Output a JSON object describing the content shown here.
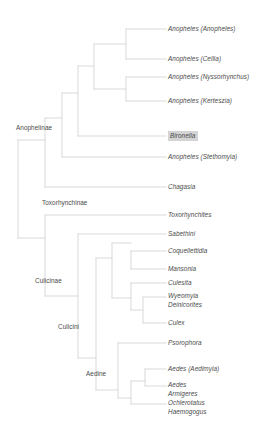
{
  "figure": {
    "type": "phylogenetic-cladogram",
    "title": "",
    "line_color": "#d9d9d9",
    "text_color": "#4a4a4a",
    "highlight_color": "#d4d4d4",
    "background": "#ffffff"
  },
  "tips": [
    {
      "id": "anopheles-anopheles",
      "label": "Anopheles (Anopheles)",
      "x": 168,
      "y": 29,
      "highlight": false
    },
    {
      "id": "anopheles-cellia",
      "label": "Anopheles (Cellia)",
      "x": 168,
      "y": 59,
      "highlight": false
    },
    {
      "id": "anopheles-nyssorhynchus",
      "label": "Anopheles (Nyssorhynchus)",
      "x": 168,
      "y": 77,
      "highlight": false
    },
    {
      "id": "anopheles-kerteszia",
      "label": "Anopheles (Kerteszia)",
      "x": 168,
      "y": 101,
      "highlight": false
    },
    {
      "id": "bironella",
      "label": "Bironella",
      "x": 168,
      "y": 136,
      "highlight": true
    },
    {
      "id": "anopheles-stethomyia",
      "label": "Anopheles (Stethomyia)",
      "x": 168,
      "y": 157,
      "highlight": false
    },
    {
      "id": "chagasia",
      "label": "Chagasia",
      "x": 168,
      "y": 187,
      "highlight": false
    },
    {
      "id": "toxorhynchites",
      "label": "Toxorhynchites",
      "x": 168,
      "y": 215,
      "highlight": false
    },
    {
      "id": "sabethini",
      "label": "Sabethini",
      "x": 168,
      "y": 234,
      "highlight": false
    },
    {
      "id": "coquellettidia",
      "label": "Coquellettidia",
      "x": 168,
      "y": 251,
      "highlight": false
    },
    {
      "id": "mansonia",
      "label": "Mansonia",
      "x": 168,
      "y": 269,
      "highlight": false
    },
    {
      "id": "culiseta",
      "label": "Culesita",
      "x": 168,
      "y": 283,
      "highlight": false
    },
    {
      "id": "culex",
      "label": "Culex",
      "x": 168,
      "y": 323,
      "highlight": false
    },
    {
      "id": "psorophora",
      "label": "Psorophora",
      "x": 168,
      "y": 343,
      "highlight": false
    },
    {
      "id": "aedes-aedimyia",
      "label": "Aedes (Aedimyia)",
      "x": 168,
      "y": 369,
      "highlight": false
    }
  ],
  "tip_stacks": [
    {
      "id": "wyeomyia-deinocerites",
      "x": 168,
      "y": 297,
      "lines": [
        "Wyeomyia",
        "Deinicorites"
      ]
    },
    {
      "id": "aedes-armigeres",
      "x": 168,
      "y": 386,
      "lines": [
        "Aedes",
        "Armigeres"
      ]
    },
    {
      "id": "ochlerotatus-haemogogus",
      "x": 168,
      "y": 404,
      "lines": [
        "Ochlerotatus",
        "Haemogogus"
      ]
    }
  ],
  "clades": [
    {
      "id": "anophelinae",
      "label": "Anophelinae",
      "x": 16,
      "y": 128
    },
    {
      "id": "toxorhynchinae",
      "label": "Toxorhynchinae",
      "x": 42,
      "y": 203
    },
    {
      "id": "culicinae",
      "label": "Culicinae",
      "x": 35,
      "y": 281
    },
    {
      "id": "culicini",
      "label": "Culicini",
      "x": 58,
      "y": 327
    },
    {
      "id": "aedine",
      "label": "Aedine",
      "x": 86,
      "y": 374
    }
  ],
  "branches": [
    {
      "id": "root-vertical",
      "x1": 18,
      "y1": 140,
      "x2": 18,
      "y2": 238
    },
    {
      "id": "root-to-anophelinae",
      "x1": 18,
      "y1": 140,
      "x2": 45,
      "y2": 140
    },
    {
      "id": "root-to-culicinae",
      "x1": 18,
      "y1": 238,
      "x2": 45,
      "y2": 238
    },
    {
      "id": "anophelinae-vertical",
      "x1": 45,
      "y1": 118,
      "x2": 45,
      "y2": 187
    },
    {
      "id": "anophelinae-to-chagasia",
      "x1": 45,
      "y1": 187,
      "x2": 166,
      "y2": 187
    },
    {
      "id": "anophelinae-to-node2",
      "x1": 45,
      "y1": 118,
      "x2": 62,
      "y2": 118
    },
    {
      "id": "node2-vertical",
      "x1": 62,
      "y1": 93,
      "x2": 62,
      "y2": 157
    },
    {
      "id": "node2-to-stethomyia",
      "x1": 62,
      "y1": 157,
      "x2": 166,
      "y2": 157
    },
    {
      "id": "node2-to-node3",
      "x1": 62,
      "y1": 93,
      "x2": 78,
      "y2": 93
    },
    {
      "id": "node3-vertical",
      "x1": 78,
      "y1": 66,
      "x2": 78,
      "y2": 136
    },
    {
      "id": "node3-to-bironella",
      "x1": 78,
      "y1": 136,
      "x2": 166,
      "y2": 136
    },
    {
      "id": "node3-to-node4",
      "x1": 78,
      "y1": 66,
      "x2": 94,
      "y2": 66
    },
    {
      "id": "node4-vertical",
      "x1": 94,
      "y1": 44,
      "x2": 94,
      "y2": 89
    },
    {
      "id": "node4-to-upper-pair",
      "x1": 94,
      "y1": 44,
      "x2": 126,
      "y2": 44
    },
    {
      "id": "node4-to-lower-pair",
      "x1": 94,
      "y1": 89,
      "x2": 126,
      "y2": 89
    },
    {
      "id": "upper-pair-vertical",
      "x1": 126,
      "y1": 29,
      "x2": 126,
      "y2": 59
    },
    {
      "id": "tip-anopheles-anopheles",
      "x1": 126,
      "y1": 29,
      "x2": 166,
      "y2": 29
    },
    {
      "id": "tip-anopheles-cellia",
      "x1": 126,
      "y1": 59,
      "x2": 166,
      "y2": 59
    },
    {
      "id": "lower-pair-vertical",
      "x1": 126,
      "y1": 77,
      "x2": 126,
      "y2": 101
    },
    {
      "id": "tip-anopheles-nyssorhynchus",
      "x1": 126,
      "y1": 77,
      "x2": 166,
      "y2": 77
    },
    {
      "id": "tip-anopheles-kerteszia",
      "x1": 126,
      "y1": 101,
      "x2": 166,
      "y2": 101
    },
    {
      "id": "culicinae-vertical",
      "x1": 45,
      "y1": 215,
      "x2": 45,
      "y2": 296
    },
    {
      "id": "culicinae-to-toxorhynchites",
      "x1": 45,
      "y1": 215,
      "x2": 166,
      "y2": 215
    },
    {
      "id": "culicinae-to-node6",
      "x1": 45,
      "y1": 296,
      "x2": 78,
      "y2": 296
    },
    {
      "id": "node6-vertical",
      "x1": 78,
      "y1": 234,
      "x2": 78,
      "y2": 358
    },
    {
      "id": "node6-to-sabethini",
      "x1": 78,
      "y1": 234,
      "x2": 166,
      "y2": 234
    },
    {
      "id": "node6-to-aedine",
      "x1": 78,
      "y1": 358,
      "x2": 96,
      "y2": 358
    },
    {
      "id": "culicini-vertical",
      "x1": 96,
      "y1": 258,
      "x2": 96,
      "y2": 390
    },
    {
      "id": "culicini-upper",
      "x1": 96,
      "y1": 258,
      "x2": 112,
      "y2": 258
    },
    {
      "id": "node7-vertical",
      "x1": 112,
      "y1": 243,
      "x2": 112,
      "y2": 298
    },
    {
      "id": "node7-to-coq-man",
      "x1": 112,
      "y1": 243,
      "x2": 131,
      "y2": 243
    },
    {
      "id": "node7-to-node9",
      "x1": 112,
      "y1": 298,
      "x2": 131,
      "y2": 298
    },
    {
      "id": "coq-man-vertical",
      "x1": 131,
      "y1": 251,
      "x2": 131,
      "y2": 269
    },
    {
      "id": "tip-coquellettidia",
      "x1": 131,
      "y1": 251,
      "x2": 166,
      "y2": 251
    },
    {
      "id": "tip-mansonia",
      "x1": 131,
      "y1": 269,
      "x2": 166,
      "y2": 269
    },
    {
      "id": "node9-vertical",
      "x1": 131,
      "y1": 283,
      "x2": 131,
      "y2": 310
    },
    {
      "id": "tip-culiseta",
      "x1": 131,
      "y1": 283,
      "x2": 166,
      "y2": 283
    },
    {
      "id": "node9-to-node10",
      "x1": 131,
      "y1": 310,
      "x2": 143,
      "y2": 310
    },
    {
      "id": "node10-vertical",
      "x1": 143,
      "y1": 297,
      "x2": 143,
      "y2": 323
    },
    {
      "id": "tip-wyeomyia-deinocerites",
      "x1": 143,
      "y1": 297,
      "x2": 166,
      "y2": 297
    },
    {
      "id": "tip-culex",
      "x1": 143,
      "y1": 323,
      "x2": 166,
      "y2": 323
    },
    {
      "id": "aedine-vertical",
      "x1": 118,
      "y1": 343,
      "x2": 118,
      "y2": 398
    },
    {
      "id": "aedine-root-link",
      "x1": 96,
      "y1": 390,
      "x2": 118,
      "y2": 390
    },
    {
      "id": "tip-psorophora",
      "x1": 118,
      "y1": 343,
      "x2": 166,
      "y2": 343
    },
    {
      "id": "aedine-to-node12",
      "x1": 118,
      "y1": 398,
      "x2": 131,
      "y2": 398
    },
    {
      "id": "node12-vertical",
      "x1": 131,
      "y1": 381,
      "x2": 131,
      "y2": 404
    },
    {
      "id": "tip-ochlerotatus-haemogogus",
      "x1": 131,
      "y1": 404,
      "x2": 166,
      "y2": 404
    },
    {
      "id": "node12-to-node13",
      "x1": 131,
      "y1": 381,
      "x2": 145,
      "y2": 381
    },
    {
      "id": "node13-vertical",
      "x1": 145,
      "y1": 369,
      "x2": 145,
      "y2": 386
    },
    {
      "id": "tip-aedes-aedimyia",
      "x1": 145,
      "y1": 369,
      "x2": 166,
      "y2": 369
    },
    {
      "id": "tip-aedes-armigeres",
      "x1": 145,
      "y1": 386,
      "x2": 166,
      "y2": 386
    }
  ]
}
